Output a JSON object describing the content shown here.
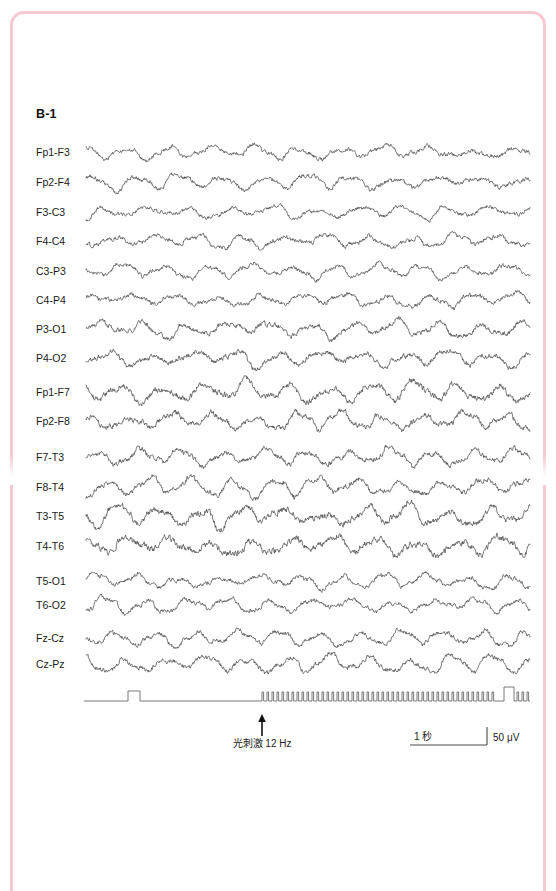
{
  "figure": {
    "panel_label": "B-1",
    "border_color": "#f6c9d2",
    "trace_color": "#4a4a4a",
    "marker_color": "#6b6b6b"
  },
  "chart_data": {
    "type": "line",
    "title": "B-1",
    "xlabel": "",
    "ylabel": "",
    "grid": false,
    "legend_position": "none",
    "x": "time",
    "time_scale_label": "1 秒",
    "amplitude_scale_label": "50 μV",
    "channels": [
      {
        "name": "Fp1-F3",
        "group": 1,
        "baseline_y": 152,
        "amplitude": 5.0,
        "rhythm": "mixed-irregular"
      },
      {
        "name": "Fp2-F4",
        "group": 1,
        "baseline_y": 182,
        "amplitude": 5.2,
        "rhythm": "mixed-irregular"
      },
      {
        "name": "F3-C3",
        "group": 1,
        "baseline_y": 212,
        "amplitude": 4.6,
        "rhythm": "low-voltage-fast"
      },
      {
        "name": "F4-C4",
        "group": 1,
        "baseline_y": 241,
        "amplitude": 5.0,
        "rhythm": "low-voltage-fast"
      },
      {
        "name": "C3-P3",
        "group": 2,
        "baseline_y": 271,
        "amplitude": 5.0,
        "rhythm": "alpha"
      },
      {
        "name": "C4-P4",
        "group": 2,
        "baseline_y": 300,
        "amplitude": 5.4,
        "rhythm": "alpha"
      },
      {
        "name": "P3-O1",
        "group": 2,
        "baseline_y": 329,
        "amplitude": 6.0,
        "rhythm": "alpha"
      },
      {
        "name": "P4-O2",
        "group": 2,
        "baseline_y": 358,
        "amplitude": 6.2,
        "rhythm": "alpha"
      },
      {
        "name": "Fp1-F7",
        "group": 3,
        "baseline_y": 392,
        "amplitude": 7.2,
        "rhythm": "high-voltage-alpha"
      },
      {
        "name": "Fp2-F8",
        "group": 3,
        "baseline_y": 421,
        "amplitude": 6.4,
        "rhythm": "high-voltage-alpha"
      },
      {
        "name": "F7-T3",
        "group": 4,
        "baseline_y": 457,
        "amplitude": 6.0,
        "rhythm": "alpha"
      },
      {
        "name": "F8-T4",
        "group": 4,
        "baseline_y": 487,
        "amplitude": 6.0,
        "rhythm": "alpha"
      },
      {
        "name": "T3-T5",
        "group": 4,
        "baseline_y": 516,
        "amplitude": 7.5,
        "rhythm": "high-voltage-alpha"
      },
      {
        "name": "T4-T6",
        "group": 4,
        "baseline_y": 546,
        "amplitude": 7.8,
        "rhythm": "high-voltage-alpha"
      },
      {
        "name": "T5-O1",
        "group": 5,
        "baseline_y": 581,
        "amplitude": 5.0,
        "rhythm": "alpha"
      },
      {
        "name": "T6-O2",
        "group": 5,
        "baseline_y": 605,
        "amplitude": 5.0,
        "rhythm": "alpha"
      },
      {
        "name": "Fz-Cz",
        "group": 6,
        "baseline_y": 638,
        "amplitude": 5.4,
        "rhythm": "mixed-irregular"
      },
      {
        "name": "Cz-Pz",
        "group": 6,
        "baseline_y": 664,
        "amplitude": 5.8,
        "rhythm": "mixed-irregular"
      }
    ],
    "marker_channel": {
      "baseline_y": 701,
      "x_start": 84,
      "x_end": 530,
      "single_pulse": {
        "x_start": 128,
        "x_end": 140,
        "height": 10
      },
      "pulse_train": {
        "x_start": 262,
        "x_end": 497,
        "count": 47,
        "height": 9,
        "frequency_hz": 12
      },
      "end_pulse": {
        "x_start": 504,
        "x_end": 514,
        "height": 14
      }
    },
    "annotations": [
      {
        "text": "光刺激 12 Hz",
        "arrow": "up",
        "x": 262,
        "y": 747,
        "arrow_tip_y": 714,
        "arrow_tail_y": 736
      }
    ],
    "scale_bars": {
      "time": {
        "label": "1 秒",
        "x_start": 410,
        "x_end": 487,
        "y": 745
      },
      "amplitude": {
        "label": "50 μV",
        "x": 487,
        "y_top": 727,
        "y_bottom": 745
      }
    }
  }
}
